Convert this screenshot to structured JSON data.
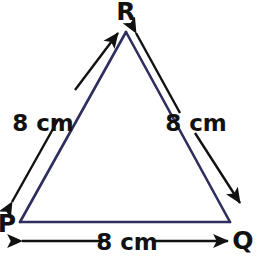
{
  "figure": {
    "kind": "geometry-diagram",
    "shape_name": "equilateral-triangle",
    "background_color": "#ffffff",
    "triangle_stroke_color": "#2d2d5e",
    "dimension_stroke_color": "#111111",
    "label_color": "#111111"
  },
  "vertices": [
    {
      "id": "R",
      "label": "R",
      "x": 126,
      "y": 32,
      "label_x": 126,
      "label_y": 20
    },
    {
      "id": "P",
      "label": "P",
      "x": 20,
      "y": 222,
      "label_x": 7,
      "label_y": 228
    },
    {
      "id": "Q",
      "label": "Q",
      "x": 230,
      "y": 222,
      "label_x": 243,
      "label_y": 247
    }
  ],
  "sides": [
    {
      "id": "PR",
      "from": "P",
      "to": "R",
      "measure_label": "8 cm",
      "label_x": 43,
      "label_y": 123,
      "arrow_kind": "double-headed"
    },
    {
      "id": "RQ",
      "from": "R",
      "to": "Q",
      "measure_label": "8 cm",
      "label_x": 196,
      "label_y": 123,
      "arrow_kind": "double-headed"
    },
    {
      "id": "PQ",
      "from": "P",
      "to": "Q",
      "measure_label": "8 cm",
      "label_x": 127,
      "label_y": 247,
      "arrow_kind": "double-headed"
    }
  ]
}
